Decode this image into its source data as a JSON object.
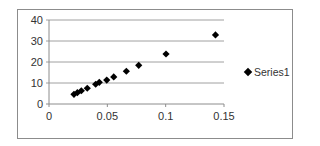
{
  "chart_data": {
    "type": "scatter",
    "title": "",
    "xlabel": "",
    "ylabel": "",
    "xlim": [
      0,
      0.15
    ],
    "ylim": [
      0,
      40
    ],
    "x_ticks": [
      "0",
      "0.05",
      "0.1",
      "0.15"
    ],
    "y_ticks": [
      "0",
      "10",
      "20",
      "30",
      "40"
    ],
    "grid": "horizontal major gridlines",
    "legend_position": "right",
    "marker": "diamond",
    "marker_color": "#000000",
    "series": [
      {
        "name": "Series1",
        "points": [
          [
            0.0214,
            4.6
          ],
          [
            0.0243,
            5.4
          ],
          [
            0.0277,
            6.3
          ],
          [
            0.0328,
            7.5
          ],
          [
            0.04,
            9.4
          ],
          [
            0.0431,
            10.3
          ],
          [
            0.0495,
            11.4
          ],
          [
            0.0555,
            12.9
          ],
          [
            0.0663,
            15.6
          ],
          [
            0.0769,
            18.4
          ],
          [
            0.1003,
            23.8
          ],
          [
            0.1427,
            32.9
          ]
        ]
      }
    ]
  },
  "legend": {
    "label": "Series1"
  }
}
